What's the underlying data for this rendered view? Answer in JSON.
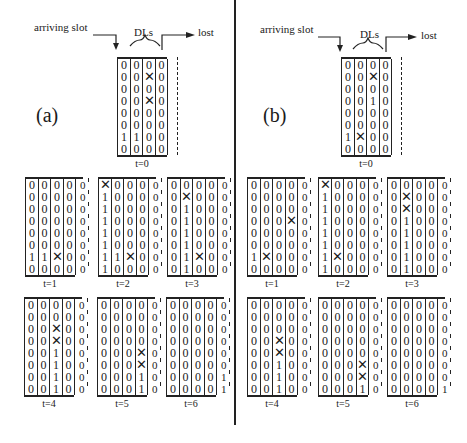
{
  "panels": [
    {
      "id": "a",
      "label": "(a)",
      "header": {
        "arriving": "arriving slot",
        "dls": "DLs",
        "lost": "lost"
      },
      "initial": {
        "time": "t=0",
        "columns": [
          [
            "0",
            "0",
            "0",
            "0",
            "0",
            "0",
            "1",
            "0"
          ],
          [
            "0",
            "0",
            "0",
            "0",
            "0",
            "0",
            "1",
            "0"
          ],
          [
            "0",
            "X",
            "0",
            "X",
            "0",
            "0",
            "0",
            "0"
          ],
          [
            "0",
            "0",
            "0",
            "0",
            "0",
            "0",
            "0",
            "0"
          ]
        ]
      },
      "steps": [
        {
          "time": "t=1",
          "columns": [
            [
              "0",
              "0",
              "0",
              "0",
              "0",
              "0",
              "1",
              "0"
            ],
            [
              "0",
              "0",
              "0",
              "0",
              "0",
              "0",
              "1",
              "0"
            ],
            [
              "0",
              "0",
              "0",
              "0",
              "0",
              "0",
              "X",
              "0"
            ],
            [
              "0",
              "0",
              "0",
              "0",
              "0",
              "0",
              "0",
              "0"
            ]
          ],
          "lost": [
            "0",
            "0",
            "0",
            "0",
            "0",
            "0",
            "0",
            "0"
          ]
        },
        {
          "time": "t=2",
          "columns": [
            [
              "X",
              "1",
              "1",
              "1",
              "1",
              "1",
              "1",
              "1"
            ],
            [
              "0",
              "0",
              "0",
              "0",
              "0",
              "0",
              "1",
              "0"
            ],
            [
              "0",
              "0",
              "0",
              "0",
              "0",
              "0",
              "X",
              "0"
            ],
            [
              "0",
              "0",
              "0",
              "0",
              "0",
              "0",
              "0",
              "0"
            ]
          ],
          "lost": [
            "0",
            "0",
            "0",
            "0",
            "0",
            "0",
            "0",
            "0"
          ]
        },
        {
          "time": "t=3",
          "columns": [
            [
              "0",
              "0",
              "0",
              "0",
              "0",
              "0",
              "0",
              "0"
            ],
            [
              "0",
              "X",
              "1",
              "1",
              "1",
              "1",
              "1",
              "1"
            ],
            [
              "0",
              "0",
              "0",
              "0",
              "0",
              "0",
              "X",
              "0"
            ],
            [
              "0",
              "0",
              "0",
              "0",
              "0",
              "0",
              "0",
              "0"
            ]
          ],
          "lost": [
            "0",
            "0",
            "0",
            "0",
            "0",
            "0",
            "0",
            "0"
          ]
        },
        {
          "time": "t=4",
          "columns": [
            [
              "0",
              "0",
              "0",
              "0",
              "0",
              "0",
              "0",
              "0"
            ],
            [
              "0",
              "0",
              "0",
              "0",
              "0",
              "0",
              "0",
              "0"
            ],
            [
              "0",
              "0",
              "X",
              "X",
              "1",
              "1",
              "1",
              "1"
            ],
            [
              "0",
              "0",
              "0",
              "0",
              "0",
              "0",
              "0",
              "0"
            ]
          ],
          "lost": [
            "0",
            "0",
            "0",
            "0",
            "0",
            "0",
            "0",
            "0"
          ]
        },
        {
          "time": "t=5",
          "columns": [
            [
              "0",
              "0",
              "0",
              "0",
              "0",
              "0",
              "0",
              "0"
            ],
            [
              "0",
              "0",
              "0",
              "0",
              "0",
              "0",
              "0",
              "0"
            ],
            [
              "0",
              "0",
              "0",
              "0",
              "0",
              "0",
              "0",
              "0"
            ],
            [
              "0",
              "0",
              "0",
              "0",
              "X",
              "X",
              "1",
              "1"
            ]
          ],
          "lost": [
            "0",
            "0",
            "0",
            "0",
            "0",
            "0",
            "0",
            "0"
          ]
        },
        {
          "time": "t=6",
          "columns": [
            [
              "0",
              "0",
              "0",
              "0",
              "0",
              "0",
              "0",
              "0"
            ],
            [
              "0",
              "0",
              "0",
              "0",
              "0",
              "0",
              "0",
              "0"
            ],
            [
              "0",
              "0",
              "0",
              "0",
              "0",
              "0",
              "0",
              "0"
            ],
            [
              "0",
              "0",
              "0",
              "0",
              "0",
              "0",
              "0",
              "0"
            ]
          ],
          "lost": [
            "0",
            "0",
            "0",
            "0",
            "0",
            "0",
            "1",
            "1"
          ]
        }
      ]
    },
    {
      "id": "b",
      "label": "(b)",
      "header": {
        "arriving": "arriving slot",
        "dls": "DLs",
        "lost": "lost"
      },
      "initial": {
        "time": "t=0",
        "columns": [
          [
            "0",
            "0",
            "0",
            "0",
            "0",
            "0",
            "1",
            "0"
          ],
          [
            "0",
            "0",
            "0",
            "0",
            "0",
            "0",
            "X",
            "0"
          ],
          [
            "0",
            "X",
            "0",
            "1",
            "0",
            "0",
            "0",
            "0"
          ],
          [
            "0",
            "0",
            "0",
            "0",
            "0",
            "0",
            "0",
            "0"
          ]
        ]
      },
      "steps": [
        {
          "time": "t=1",
          "columns": [
            [
              "0",
              "0",
              "0",
              "0",
              "0",
              "0",
              "1",
              "0"
            ],
            [
              "0",
              "0",
              "0",
              "0",
              "0",
              "0",
              "X",
              "0"
            ],
            [
              "0",
              "0",
              "0",
              "0",
              "0",
              "0",
              "0",
              "0"
            ],
            [
              "0",
              "0",
              "0",
              "X",
              "0",
              "0",
              "0",
              "0"
            ]
          ],
          "lost": [
            "0",
            "0",
            "0",
            "0",
            "0",
            "0",
            "0",
            "0"
          ]
        },
        {
          "time": "t=2",
          "columns": [
            [
              "X",
              "1",
              "1",
              "1",
              "1",
              "1",
              "1",
              "1"
            ],
            [
              "0",
              "0",
              "0",
              "0",
              "0",
              "0",
              "X",
              "0"
            ],
            [
              "0",
              "0",
              "0",
              "0",
              "0",
              "0",
              "0",
              "0"
            ],
            [
              "0",
              "0",
              "0",
              "0",
              "0",
              "0",
              "0",
              "0"
            ]
          ],
          "lost": [
            "0",
            "0",
            "0",
            "0",
            "0",
            "0",
            "0",
            "0"
          ]
        },
        {
          "time": "t=3",
          "columns": [
            [
              "0",
              "0",
              "0",
              "0",
              "0",
              "0",
              "0",
              "0"
            ],
            [
              "0",
              "X",
              "X",
              "1",
              "1",
              "1",
              "1",
              "1"
            ],
            [
              "0",
              "0",
              "0",
              "0",
              "0",
              "0",
              "0",
              "0"
            ],
            [
              "0",
              "0",
              "0",
              "0",
              "0",
              "0",
              "0",
              "0"
            ]
          ],
          "lost": [
            "0",
            "0",
            "0",
            "0",
            "0",
            "0",
            "0",
            "0"
          ]
        },
        {
          "time": "t=4",
          "columns": [
            [
              "0",
              "0",
              "0",
              "0",
              "0",
              "0",
              "0",
              "0"
            ],
            [
              "0",
              "0",
              "0",
              "0",
              "0",
              "0",
              "0",
              "0"
            ],
            [
              "0",
              "0",
              "0",
              "X",
              "X",
              "1",
              "1",
              "1"
            ],
            [
              "0",
              "0",
              "0",
              "0",
              "0",
              "0",
              "0",
              "0"
            ]
          ],
          "lost": [
            "0",
            "0",
            "0",
            "0",
            "0",
            "0",
            "0",
            "0"
          ]
        },
        {
          "time": "t=5",
          "columns": [
            [
              "0",
              "0",
              "0",
              "0",
              "0",
              "0",
              "0",
              "0"
            ],
            [
              "0",
              "0",
              "0",
              "0",
              "0",
              "0",
              "0",
              "0"
            ],
            [
              "0",
              "0",
              "0",
              "0",
              "0",
              "0",
              "0",
              "0"
            ],
            [
              "0",
              "0",
              "0",
              "0",
              "0",
              "X",
              "X",
              "1"
            ]
          ],
          "lost": [
            "0",
            "0",
            "0",
            "0",
            "0",
            "0",
            "0",
            "0"
          ]
        },
        {
          "time": "t=6",
          "columns": [
            [
              "0",
              "0",
              "0",
              "0",
              "0",
              "0",
              "0",
              "0"
            ],
            [
              "0",
              "0",
              "0",
              "0",
              "0",
              "0",
              "0",
              "0"
            ],
            [
              "0",
              "0",
              "0",
              "0",
              "0",
              "0",
              "0",
              "0"
            ],
            [
              "0",
              "0",
              "0",
              "0",
              "0",
              "0",
              "0",
              "0"
            ]
          ],
          "lost": [
            "0",
            "0",
            "0",
            "0",
            "0",
            "0",
            "0",
            "1"
          ]
        }
      ]
    }
  ]
}
